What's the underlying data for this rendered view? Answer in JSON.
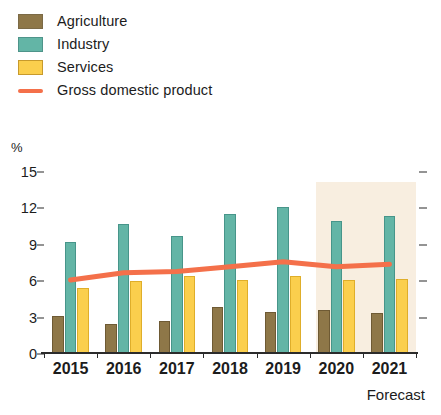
{
  "legend": {
    "items": [
      {
        "label": "Agriculture",
        "color": "#8e7748",
        "marker": "swatch"
      },
      {
        "label": "Industry",
        "color": "#63b5a6",
        "marker": "swatch"
      },
      {
        "label": "Services",
        "color": "#fbcf4d",
        "marker": "swatch"
      },
      {
        "label": "Gross domestic product",
        "color": "#f4704a",
        "marker": "line"
      }
    ]
  },
  "axis": {
    "unit": "%",
    "y_ticks": [
      "15",
      "12",
      "9",
      "6",
      "3",
      "0"
    ],
    "forecast_note": "Forecast"
  },
  "chart_data": {
    "type": "bar",
    "title": "",
    "subtitle": "",
    "xlabel": "",
    "ylabel": "%",
    "ylim": [
      0,
      15
    ],
    "ytick_values": [
      0,
      3,
      6,
      9,
      12,
      15
    ],
    "grid": false,
    "legend_position": "top-left",
    "categories": [
      "2015",
      "2016",
      "2017",
      "2018",
      "2019",
      "2020",
      "2021"
    ],
    "series": [
      {
        "name": "Agriculture",
        "type": "bar",
        "color": "#8e7748",
        "values": [
          3.1,
          2.5,
          2.7,
          3.9,
          3.5,
          3.6,
          3.4
        ]
      },
      {
        "name": "Industry",
        "type": "bar",
        "color": "#63b5a6",
        "values": [
          9.2,
          10.7,
          9.7,
          11.5,
          12.1,
          11.0,
          11.4
        ]
      },
      {
        "name": "Services",
        "type": "bar",
        "color": "#fbcf4d",
        "values": [
          5.4,
          6.0,
          6.4,
          6.1,
          6.4,
          6.1,
          6.2
        ]
      },
      {
        "name": "Gross domestic product",
        "type": "line",
        "color": "#f4704a",
        "values": [
          6.1,
          6.7,
          6.8,
          7.2,
          7.6,
          7.2,
          7.4
        ]
      }
    ],
    "annotations": [
      {
        "text": "Forecast",
        "covers": [
          "2020",
          "2021"
        ],
        "shading_color": "#f6e8d5"
      }
    ]
  }
}
